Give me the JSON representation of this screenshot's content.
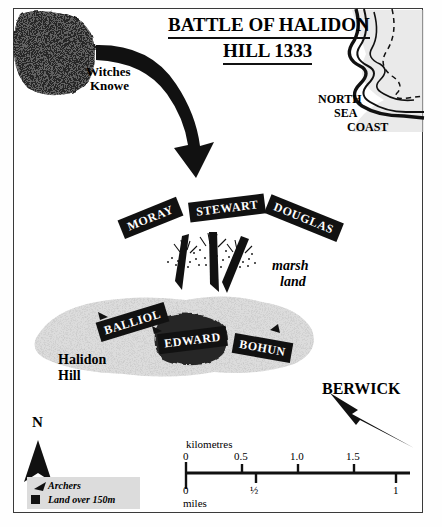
{
  "map": {
    "title_line1": "BATTLE OF HALIDON",
    "title_line2": "HILL 1333",
    "places": {
      "witches_knowe": "Witches\nKnowe",
      "witches_knowe_l1": "Witches",
      "witches_knowe_l2": "Knowe",
      "north_sea_l1": "NORTH",
      "north_sea_l2": "SEA",
      "north_sea_l3": "COAST",
      "marsh_l1": "marsh",
      "marsh_l2": "land",
      "halidon_l1": "Halidon",
      "halidon_l2": "Hill",
      "berwick": "BERWICK"
    },
    "scottish_divisions": [
      {
        "name": "MORAY",
        "rotation": -22
      },
      {
        "name": "STEWART",
        "rotation": -7
      },
      {
        "name": "DOUGLAS",
        "rotation": 22
      }
    ],
    "english_divisions": [
      {
        "name": "BALLIOL",
        "rotation": -17
      },
      {
        "name": "EDWARD",
        "rotation": -7
      },
      {
        "name": "BOHUN",
        "rotation": 10
      }
    ],
    "compass": {
      "label": "N"
    },
    "legend": {
      "items": [
        {
          "symbol": "archer-arrow",
          "label": "Archers"
        },
        {
          "symbol": "black-square",
          "label": "Land over 150m"
        }
      ]
    },
    "scalebar": {
      "top_unit": "kilometres",
      "top_ticks": [
        "0",
        "0.5",
        "1.0",
        "1.5"
      ],
      "bottom_unit": "miles",
      "bottom_ticks": [
        "0",
        "½",
        "1"
      ]
    },
    "colors": {
      "ink": "#111111",
      "frame": "#3a3a3a",
      "high_ground": "#1f1f1f",
      "hill_fill": "#dcdcdc",
      "sea_fill": "#d9d9d9",
      "legend_bg": "#dcdcdc",
      "paper": "#ffffff"
    }
  }
}
